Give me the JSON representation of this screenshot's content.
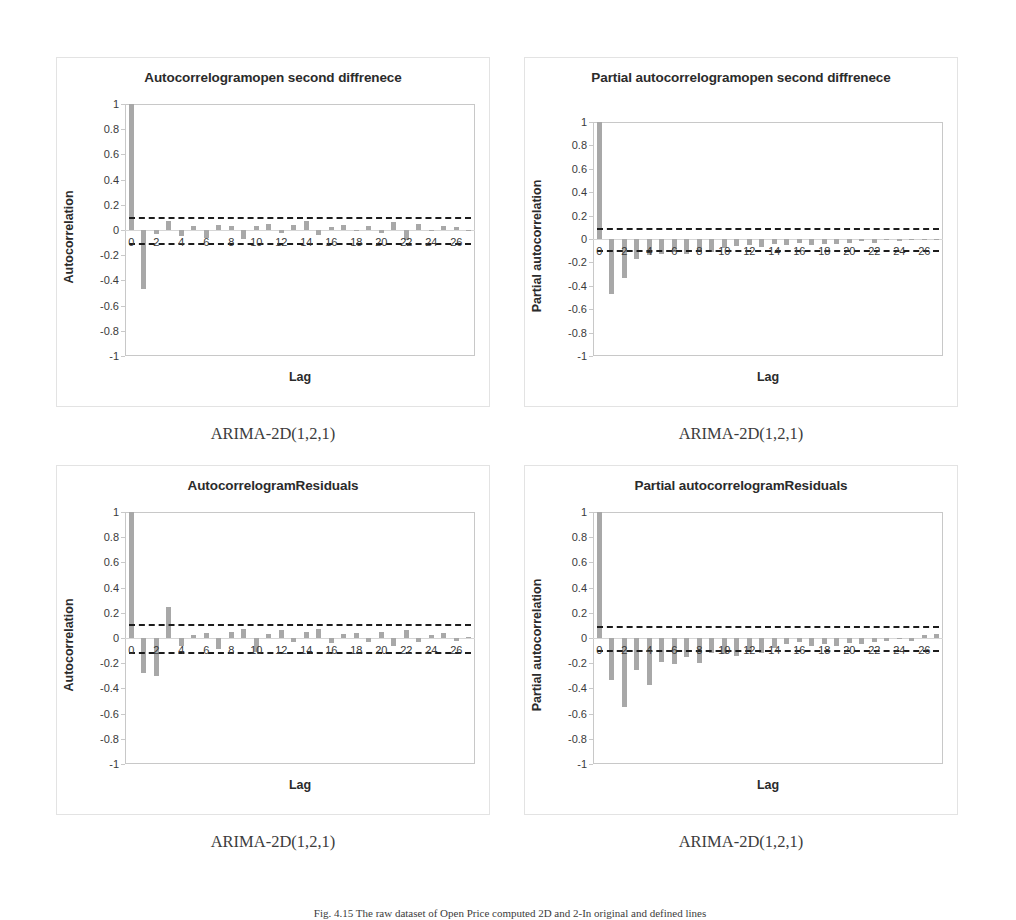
{
  "figure": {
    "caption": "Fig. 4.15  The raw dataset of Open Price computed 2D and 2-In original and defined lines"
  },
  "axis": {
    "y_ticks": [
      "1",
      "0.8",
      "0.6",
      "0.4",
      "0.2",
      "0",
      "-0.2",
      "-0.4",
      "-0.6",
      "-0.8",
      "-1"
    ],
    "y_values": [
      1,
      0.8,
      0.6,
      0.4,
      0.2,
      0,
      -0.2,
      -0.4,
      -0.6,
      -0.8,
      -1
    ],
    "x_ticks": [
      "0",
      "2",
      "4",
      "6",
      "8",
      "10",
      "12",
      "14",
      "16",
      "18",
      "20",
      "22",
      "24",
      "26"
    ],
    "x_title": "Lag",
    "ylim": [
      -1,
      1
    ],
    "xlim": [
      -0.5,
      27.5
    ]
  },
  "colors": {
    "bar": "#a8a8a8",
    "confidence_band": "#1c1c1c",
    "plot_border": "#c8c8c8",
    "panel_border": "#e3e3e3",
    "text": "#2b2b2b"
  },
  "charts": [
    {
      "id": "acf-open-second-difference",
      "title": "Autocorrelogramopen second diffrenece",
      "ylabel": "Autocorrelation",
      "caption": "ARIMA-2D(1,2,1)",
      "confidence": 0.105
    },
    {
      "id": "pacf-open-second-difference",
      "title": "Partial autocorrelogramopen second diffrenece",
      "ylabel": "Partial autocorrelation",
      "caption": "ARIMA-2D(1,2,1)",
      "confidence": 0.095
    },
    {
      "id": "acf-residuals",
      "title": "AutocorrelogramResiduals",
      "ylabel": "Autocorrelation",
      "caption": "ARIMA-2D(1,2,1)",
      "confidence": 0.108
    },
    {
      "id": "pacf-residuals",
      "title": "Partial autocorrelogramResiduals",
      "ylabel": "Partial autocorrelation",
      "caption": "ARIMA-2D(1,2,1)",
      "confidence": 0.092
    }
  ],
  "chart_data": [
    {
      "type": "bar",
      "id": "acf-open-second-difference",
      "title": "Autocorrelogramopen second diffrenece",
      "xlabel": "Lag",
      "ylabel": "Autocorrelation",
      "ylim": [
        -1,
        1
      ],
      "grid": false,
      "legend": "none",
      "annotations": [
        "upper confidence band +0.105 (dashed)",
        "lower confidence band -0.105 (dashed)"
      ],
      "categories": [
        0,
        1,
        2,
        3,
        4,
        5,
        6,
        7,
        8,
        9,
        10,
        11,
        12,
        13,
        14,
        15,
        16,
        17,
        18,
        19,
        20,
        21,
        22,
        23,
        24,
        25,
        26,
        27
      ],
      "values": [
        1.0,
        -0.47,
        -0.03,
        0.07,
        -0.05,
        0.03,
        -0.06,
        0.04,
        0.03,
        -0.07,
        0.03,
        0.05,
        -0.02,
        0.04,
        0.07,
        -0.04,
        0.02,
        0.04,
        -0.01,
        0.03,
        -0.02,
        0.06,
        -0.08,
        0.05,
        -0.01,
        0.03,
        0.02,
        -0.01
      ]
    },
    {
      "type": "bar",
      "id": "pacf-open-second-difference",
      "title": "Partial autocorrelogramopen second diffrenece",
      "xlabel": "Lag",
      "ylabel": "Partial autocorrelation",
      "ylim": [
        -1,
        1
      ],
      "grid": false,
      "legend": "none",
      "annotations": [
        "upper confidence band +0.095 (dashed)",
        "lower confidence band -0.095 (dashed)"
      ],
      "categories": [
        0,
        1,
        2,
        3,
        4,
        5,
        6,
        7,
        8,
        9,
        10,
        11,
        12,
        13,
        14,
        15,
        16,
        17,
        18,
        19,
        20,
        21,
        22,
        23,
        24,
        25,
        26,
        27
      ],
      "values": [
        1.0,
        -0.47,
        -0.33,
        -0.17,
        -0.14,
        -0.13,
        -0.11,
        -0.13,
        -0.1,
        -0.11,
        -0.08,
        -0.06,
        -0.05,
        -0.07,
        -0.04,
        -0.05,
        -0.03,
        -0.05,
        -0.04,
        -0.04,
        -0.03,
        -0.02,
        -0.03,
        -0.01,
        -0.02,
        -0.01,
        -0.01,
        -0.01
      ]
    },
    {
      "type": "bar",
      "id": "acf-residuals",
      "title": "AutocorrelogramResiduals",
      "xlabel": "Lag",
      "ylabel": "Autocorrelation",
      "ylim": [
        -1,
        1
      ],
      "grid": false,
      "legend": "none",
      "annotations": [
        "upper confidence band +0.108 (dashed)",
        "lower confidence band -0.108 (dashed)"
      ],
      "categories": [
        0,
        1,
        2,
        3,
        4,
        5,
        6,
        7,
        8,
        9,
        10,
        11,
        12,
        13,
        14,
        15,
        16,
        17,
        18,
        19,
        20,
        21,
        22,
        23,
        24,
        25,
        26,
        27
      ],
      "values": [
        1.0,
        -0.28,
        -0.3,
        0.25,
        -0.06,
        0.02,
        0.04,
        -0.09,
        0.05,
        0.07,
        -0.11,
        0.03,
        0.06,
        -0.03,
        0.05,
        0.07,
        -0.04,
        0.03,
        0.04,
        -0.03,
        0.05,
        -0.06,
        0.06,
        -0.03,
        0.02,
        0.04,
        -0.02,
        0.01
      ]
    },
    {
      "type": "bar",
      "id": "pacf-residuals",
      "title": "Partial autocorrelogramResiduals",
      "xlabel": "Lag",
      "ylabel": "Partial autocorrelation",
      "ylim": [
        -1,
        1
      ],
      "grid": false,
      "legend": "none",
      "annotations": [
        "upper confidence band +0.092 (dashed)",
        "lower confidence band -0.092 (dashed)"
      ],
      "categories": [
        0,
        1,
        2,
        3,
        4,
        5,
        6,
        7,
        8,
        9,
        10,
        11,
        12,
        13,
        14,
        15,
        16,
        17,
        18,
        19,
        20,
        21,
        22,
        23,
        24,
        25,
        26,
        27
      ],
      "values": [
        1.0,
        -0.33,
        -0.55,
        -0.25,
        -0.37,
        -0.19,
        -0.21,
        -0.15,
        -0.2,
        -0.12,
        -0.13,
        -0.14,
        -0.1,
        -0.12,
        -0.08,
        -0.05,
        -0.03,
        -0.06,
        -0.05,
        -0.06,
        -0.04,
        -0.05,
        -0.03,
        -0.02,
        -0.01,
        -0.02,
        0.02,
        0.03
      ]
    }
  ]
}
